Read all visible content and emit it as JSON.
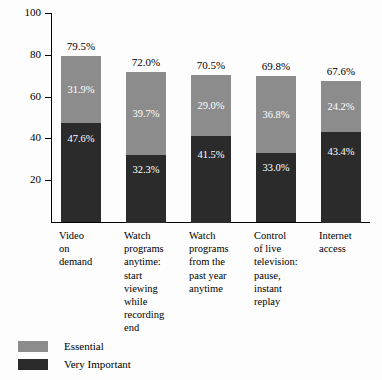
{
  "chart_data": {
    "type": "bar",
    "subtype": "stacked-vertical",
    "title": "",
    "xlabel": "",
    "ylabel": "",
    "ylim": [
      0,
      100
    ],
    "yticks": [
      0,
      20,
      40,
      60,
      80,
      100
    ],
    "ytick_labels": [
      "",
      "20",
      "40",
      "60",
      "80",
      "100"
    ],
    "grid": false,
    "legend_position": "bottom-left",
    "categories": [
      "Video on demand",
      "Watch programs anytime: start viewing while recording end",
      "Watch programs from the past year anytime",
      "Control of live television: pause, instant replay",
      "Internet access"
    ],
    "category_lines": [
      [
        "Video",
        "on",
        "demand"
      ],
      [
        "Watch",
        "programs",
        "anytime:",
        "start",
        "viewing",
        "while",
        "recording",
        "end"
      ],
      [
        "Watch",
        "programs",
        "from the",
        "past year",
        "anytime"
      ],
      [
        "Control",
        "of live",
        "television:",
        "pause,",
        "instant",
        "replay"
      ],
      [
        "Internet",
        "access"
      ]
    ],
    "series": [
      {
        "name": "Very Important",
        "color": "#2b2b2b",
        "values": [
          47.6,
          32.3,
          41.5,
          33.0,
          43.4
        ],
        "labels": [
          "47.6%",
          "32.3%",
          "41.5%",
          "33.0%",
          "43.4%"
        ]
      },
      {
        "name": "Essential",
        "color": "#8c8c8c",
        "values": [
          31.9,
          39.7,
          29.0,
          36.8,
          24.2
        ],
        "labels": [
          "31.9%",
          "39.7%",
          "29.0%",
          "36.8%",
          "24.2%"
        ]
      }
    ],
    "totals": [
      79.5,
      72.0,
      70.5,
      69.8,
      67.6
    ],
    "total_labels": [
      "79.5%",
      "72.0%",
      "70.5%",
      "69.8%",
      "67.6%"
    ]
  },
  "legend": {
    "items": [
      {
        "label": "Essential",
        "color": "#8c8c8c"
      },
      {
        "label": "Very Important",
        "color": "#2b2b2b"
      }
    ]
  }
}
